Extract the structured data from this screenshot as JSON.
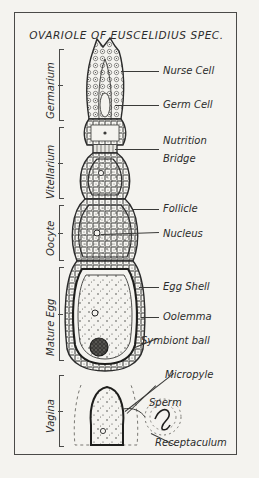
{
  "figure": {
    "title": "OVARIOLE OF EUSCELIDIUS SPEC.",
    "type": "scientific-line-diagram",
    "medium": "scanned black ink drawing on off-white paper",
    "paper_color": "#f4f3ef",
    "ink_color": "#2b2b2b",
    "frame": "thin rectangular border inset from page edge"
  },
  "region_labels": [
    {
      "id": "germarium",
      "label": "Germarium",
      "orientation": "vertical-rotated",
      "bracket": true
    },
    {
      "id": "vitellarium",
      "label": "Vitellarium",
      "orientation": "vertical-rotated",
      "bracket": true
    },
    {
      "id": "oocyte",
      "label": "Oocyte",
      "orientation": "vertical-rotated",
      "bracket": true
    },
    {
      "id": "mature-egg",
      "label": "Mature Egg",
      "orientation": "vertical-rotated",
      "bracket": true
    },
    {
      "id": "vagina",
      "label": "Vagina",
      "orientation": "vertical-rotated",
      "bracket": true
    }
  ],
  "callouts": [
    {
      "id": "nurse-cell",
      "label": "Nurse Cell",
      "leader": "horizontal"
    },
    {
      "id": "germ-cell",
      "label": "Germ Cell",
      "leader": "horizontal"
    },
    {
      "id": "nutrition-bridge",
      "label": "Nutrition\nBridge",
      "line1": "Nutrition",
      "line2": "Bridge",
      "leader": "horizontal"
    },
    {
      "id": "follicle",
      "label": "Follicle",
      "leader": "horizontal"
    },
    {
      "id": "nucleus",
      "label": "Nucleus",
      "leader": "horizontal"
    },
    {
      "id": "egg-shell",
      "label": "Egg Shell",
      "leader": "horizontal"
    },
    {
      "id": "oolemma",
      "label": "Oolemma",
      "leader": "horizontal"
    },
    {
      "id": "symbiont-ball",
      "label": "Symbiont  ball",
      "leader": "diagonal"
    },
    {
      "id": "micropyle",
      "label": "Micropyle",
      "leader": "diagonal"
    },
    {
      "id": "sperm",
      "label": "Sperm",
      "leader": "diagonal"
    },
    {
      "id": "receptaculum",
      "label": "Receptaculum",
      "leader": "diagonal"
    }
  ],
  "anatomy": {
    "germarium_apex": "pointed dome packed with small irregular cells",
    "chambers": "successive oocyte chambers bounded by brick-like follicle epithelium",
    "mature_egg": "large elongated chamber with stippled cytoplasm, dark egg shell outline",
    "symbiont_ball": "dark hatched sphere at base of mature egg",
    "receptaculum": "stippled circular sac containing a coiled sperm"
  }
}
